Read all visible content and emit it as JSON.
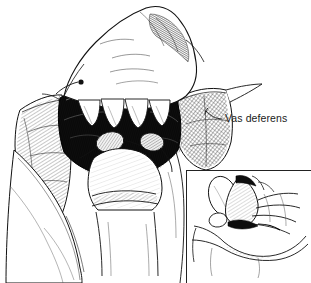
{
  "figure": {
    "kind": "medical-line-illustration",
    "technique": "pen-and-ink cross-hatching",
    "background_color": "#ffffff",
    "ink_color": "#111111"
  },
  "annotations": {
    "labels": [
      {
        "id": "vas-deferens",
        "text": "Vas deferens",
        "x": 225,
        "y": 121,
        "leader_from_x": 218,
        "leader_from_y": 118,
        "leader_to_x": 205,
        "leader_to_y": 112
      }
    ]
  },
  "inset": {
    "name": "detail-inset",
    "caption": "",
    "x": 186,
    "y": 170,
    "width": 125,
    "height": 113,
    "border_color": "#222222",
    "border_sides": "top-left"
  },
  "regions": [
    {
      "name": "surgeon-hand",
      "description": "hand and fingers retracting tissue, upper center"
    },
    {
      "name": "fingertips-row",
      "description": "four scalloped fingertips over dark surgical field"
    },
    {
      "name": "surgical-field",
      "description": "dark opened incision with exposed cord structures"
    },
    {
      "name": "surgical-drape-left",
      "description": "hatched cloth drape, left side"
    },
    {
      "name": "surgical-drape-right",
      "description": "cross-hatched cloth drape, right side"
    },
    {
      "name": "scrotum-shaft",
      "description": "rounded anatomy with banded contour, lower center"
    },
    {
      "name": "thigh-left",
      "description": "leg contour, lower left"
    }
  ]
}
